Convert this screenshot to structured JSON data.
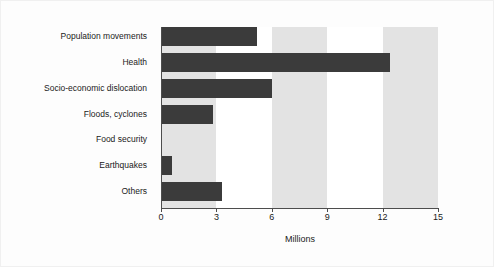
{
  "chart_data": {
    "type": "bar",
    "orientation": "horizontal",
    "title": "",
    "xlabel": "Millions",
    "ylabel": "",
    "categories": [
      "Population movements",
      "Health",
      "Socio-economic dislocation",
      "Floods, cyclones",
      "Food security",
      "Earthquakes",
      "Others"
    ],
    "values": [
      5.2,
      12.4,
      6.0,
      2.8,
      0.05,
      0.6,
      3.3
    ],
    "xlim": [
      0,
      15
    ],
    "xticks": [
      0,
      3,
      6,
      9,
      12,
      15
    ],
    "xtick_labels": [
      "0",
      "3",
      "6",
      "9",
      "12",
      "15"
    ],
    "grid": false,
    "legend": "none",
    "bar_color": "#3b3b3b",
    "band_color": "#e3e3e3",
    "plot_background": "#ffffff",
    "axis_color": "#4d4d4d",
    "shaded_bands": [
      [
        0,
        3
      ],
      [
        6,
        9
      ],
      [
        12,
        15
      ]
    ]
  }
}
